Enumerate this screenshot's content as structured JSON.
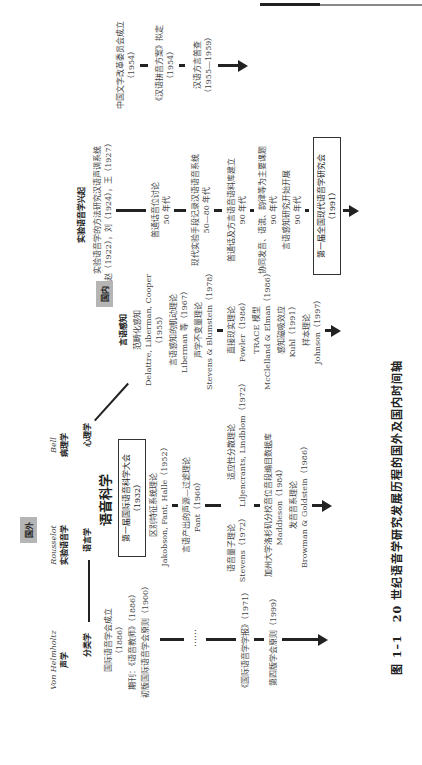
{
  "page": {
    "header_rule": true
  },
  "figure": {
    "caption": "图 1–1　20 世纪语音学研究发展历程的国外及国内时间轴",
    "foreign": {
      "label": "国外",
      "disciplines": [
        {
          "person": "Von Helmholtz",
          "field": "声学"
        },
        {
          "person": "Rousselot",
          "field": "实验语音学"
        },
        {
          "person": "Bell",
          "field": "病理学"
        }
      ],
      "branch_left": "分类学",
      "branch_mid": "语言学",
      "branch_right": "心理学",
      "core_title": "语音科学",
      "core_box": {
        "line1": "第一届国际语音科学大会",
        "line2": "（1932）"
      },
      "column_phonetics_association": [
        {
          "text": "国际语音学会成立",
          "year": "（1886）"
        },
        {
          "text": "期刊：《语音教师》（1886）"
        },
        {
          "text": "初版国际语音学会原则（1900）"
        },
        {
          "text": "……"
        },
        {
          "text": "《国际语音学学报》（1971）"
        },
        {
          "text": "第四版学会原则（1999）"
        }
      ],
      "column_speech_science": [
        {
          "text": "区别特征系统理论",
          "ref": "Jakobson, Fant, Halle（1952）"
        },
        {
          "text": "言语产出的声源—过滤理论",
          "ref": "Fant（1960）"
        },
        {
          "text": "语音量子理论",
          "ref": "Stevens（1972）"
        },
        {
          "text": "适应性分散理论",
          "ref": "Liljencrants, Lindblom（1972）"
        },
        {
          "text": "加州大学洛杉矶分校音位音段编目数据库",
          "ref": "Maddieson（1984）"
        },
        {
          "text": "发音音系理论",
          "ref": "Browman & Goldstein（1986）"
        }
      ],
      "column_perception": {
        "title": "言语感知",
        "items": [
          {
            "text": "范畴化感知",
            "ref": "Delattre, Liberman, Cooper",
            "year": "（1955）"
          },
          {
            "text": "言语感知的肌动理论",
            "ref": "Liberman 等（1967）"
          },
          {
            "text": "声学不变量理论",
            "ref": "Stevens & Blumstein（1978）"
          },
          {
            "text": "直接现实理论",
            "ref": "Fowler（1986）"
          },
          {
            "text": "TRACE 模型",
            "ref": "McClelland & Elman（1986）"
          },
          {
            "text": "感知磁吸效应",
            "ref": "Kuhl（1991）"
          },
          {
            "text": "样本理论",
            "ref": "Johnson（1997）"
          }
        ]
      }
    },
    "domestic": {
      "label": "国内",
      "title": "实验语音学兴起",
      "column_experimental": [
        {
          "text": "实验语音学的方法研究汉语声调系统",
          "ref": "赵（1922），刘（1924），王（1927）"
        },
        {
          "text": "普通话音位讨论",
          "ref": "50 年代"
        },
        {
          "text": "现代实验手段记录汉语语音系统",
          "ref": "50—80 年代"
        },
        {
          "text": "普通话及方言语音语料库建立",
          "ref": "90 年代"
        },
        {
          "text": "协同发音、语流、韵律等为主要课题",
          "ref": "90 年代"
        },
        {
          "text": "言语感知研究开始开展",
          "ref": "90 年代"
        }
      ],
      "conference_box": {
        "line1": "第一届全国现代语音学研究会",
        "line2": "（1991）"
      },
      "column_policy": [
        {
          "text": "中国文字改革委员会成立",
          "ref": "（1954）"
        },
        {
          "text": "《汉语拼音方案》拟定",
          "ref": "（1954）"
        },
        {
          "text": "汉语方言普查",
          "ref": "（1955—1959）"
        }
      ]
    }
  }
}
